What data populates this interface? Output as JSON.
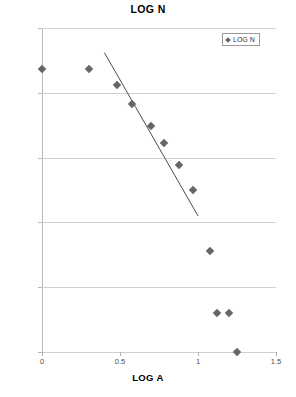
{
  "chart_data": {
    "type": "scatter",
    "title": "LOG N",
    "xlabel": "LOG A",
    "ylabel": "",
    "xlim": [
      0,
      1.5
    ],
    "ylim": [
      0,
      2.5
    ],
    "xticks": [
      "0",
      "0.5",
      "1",
      "1.5"
    ],
    "xtick_values": [
      0,
      0.5,
      1,
      1.5
    ],
    "yticks": [
      "0.00",
      "0.50",
      "1.00",
      "1.50",
      "2.00",
      "2.50"
    ],
    "ytick_values": [
      0,
      0.5,
      1,
      1.5,
      2,
      2.5
    ],
    "grid": true,
    "legend": [
      "LOG N"
    ],
    "legend_position": "top-right",
    "marker_shape": "diamond",
    "marker_color": "#666666",
    "series": [
      {
        "name": "LOG N",
        "x": [
          0.0,
          0.3,
          0.48,
          0.58,
          0.7,
          0.78,
          0.88,
          0.97,
          1.08,
          1.12,
          1.2,
          1.25
        ],
        "y": [
          2.18,
          2.18,
          2.06,
          1.91,
          1.74,
          1.61,
          1.44,
          1.25,
          0.78,
          0.3,
          0.3,
          0.0
        ]
      }
    ],
    "trendline": {
      "x": [
        0.4,
        1.0
      ],
      "y": [
        2.31,
        1.05
      ],
      "color": "#4d4d4d"
    }
  },
  "legend": {
    "entry_label": "LOG N"
  },
  "axis": {
    "x_title": "LOG A"
  },
  "title": {
    "text": "LOG N"
  }
}
